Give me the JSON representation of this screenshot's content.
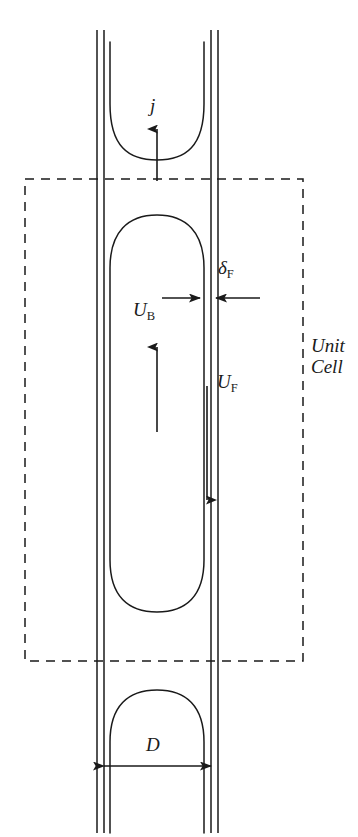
{
  "figure": {
    "type": "schematic-diagram",
    "background_color": "#ffffff",
    "line_color": "#1a1a1a",
    "width": 358,
    "height": 837
  },
  "labels": {
    "superficial_velocity": {
      "symbol": "j",
      "subscript": "",
      "meaning": "superficial velocity / mixture flux",
      "arrow_direction": "up"
    },
    "film_thickness": {
      "symbol": "δ",
      "subscript": "F",
      "meaning": "liquid film thickness",
      "arrow_direction": "inward-pair"
    },
    "bubble_velocity": {
      "symbol": "U",
      "subscript": "B",
      "meaning": "bubble rise velocity",
      "arrow_direction": "up"
    },
    "film_velocity": {
      "symbol": "U",
      "subscript": "F",
      "meaning": "falling film velocity",
      "arrow_direction": "down"
    },
    "tube_diameter": {
      "symbol": "D",
      "subscript": "",
      "meaning": "tube inner diameter",
      "arrow_direction": "double-horizontal"
    },
    "unit_cell": {
      "line1": "Unit",
      "line2": "Cell",
      "style": "italic",
      "boundary": "dashed-rectangle"
    }
  },
  "geometry": {
    "tube": {
      "outer_left_x": 97,
      "outer_right_x": 218,
      "inner_left_x": 104,
      "inner_right_x": 211,
      "top_y": 30,
      "bottom_y": 833
    },
    "unit_cell_box": {
      "left_x": 25,
      "right_x": 303,
      "top_y": 179,
      "bottom_y": 661,
      "dash_pattern": "9 7"
    },
    "main_bubble": {
      "left_x": 110,
      "right_x": 204,
      "nose_y": 215,
      "tail_y": 612
    },
    "upper_bubble_tail": {
      "left_x": 110,
      "right_x": 204,
      "top_y": 42,
      "bottom_y": 160
    },
    "lower_bubble_nose": {
      "left_x": 110,
      "right_x": 204,
      "nose_y": 690,
      "bottom_y": 833
    }
  }
}
